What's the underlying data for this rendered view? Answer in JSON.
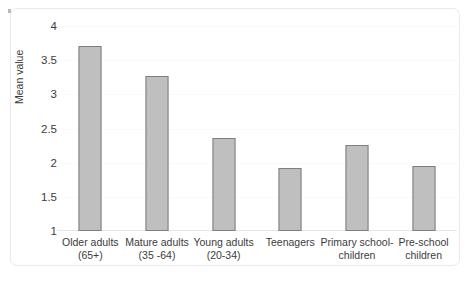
{
  "chart_data": {
    "type": "bar",
    "title": "",
    "xlabel": "",
    "ylabel": "Mean value",
    "ylim": [
      1,
      4
    ],
    "yticks": [
      "1",
      "1.5",
      "2",
      "2.5",
      "3",
      "3.5",
      "4"
    ],
    "ytick_values": [
      1,
      1.5,
      2,
      2.5,
      3,
      3.5,
      4
    ],
    "grid": true,
    "legend": "none",
    "categories": [
      "Older adults (65+)",
      "Mature adults (35 -64)",
      "Young adults (20-34)",
      "Teenagers",
      "Primary school-children",
      "Pre-school children"
    ],
    "category_lines": [
      [
        "Older adults",
        "(65+)"
      ],
      [
        "Mature adults",
        "(35 -64)"
      ],
      [
        "Young adults",
        "(20-34)"
      ],
      [
        "Teenagers",
        ""
      ],
      [
        "Primary school-",
        "children"
      ],
      [
        "Pre-school",
        "children"
      ]
    ],
    "values": [
      3.71,
      3.27,
      2.36,
      1.92,
      2.26,
      1.95
    ],
    "bar_fill": "#bfbfbf",
    "bar_border": "#7f7f7f"
  },
  "figure": {
    "frame_color": "#e9eaec",
    "background": "#ffffff",
    "text_color": "#3c3c3c"
  }
}
